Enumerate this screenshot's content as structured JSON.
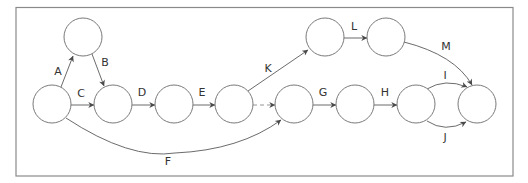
{
  "diagram": {
    "type": "activity-on-arrow network",
    "colors": {
      "border": "#8a8a8a",
      "node_stroke": "#7a7a7a",
      "edge": "#5a5a5a",
      "arrowhead": "#4a4a4a",
      "text": "#333333"
    },
    "nodes": [
      {
        "id": "n1",
        "cx": 52,
        "cy": 104
      },
      {
        "id": "n2",
        "cx": 83,
        "cy": 37
      },
      {
        "id": "n3",
        "cx": 113,
        "cy": 104
      },
      {
        "id": "n4",
        "cx": 174,
        "cy": 104
      },
      {
        "id": "n5",
        "cx": 234,
        "cy": 104
      },
      {
        "id": "n6",
        "cx": 294,
        "cy": 104
      },
      {
        "id": "n7",
        "cx": 355,
        "cy": 104
      },
      {
        "id": "n8",
        "cx": 416,
        "cy": 104
      },
      {
        "id": "n9",
        "cx": 477,
        "cy": 104
      },
      {
        "id": "n10",
        "cx": 325,
        "cy": 37
      },
      {
        "id": "n11",
        "cx": 386,
        "cy": 37
      }
    ],
    "edges": [
      {
        "label": "A",
        "from": "n1",
        "to": "n2"
      },
      {
        "label": "B",
        "from": "n2",
        "to": "n3"
      },
      {
        "label": "C",
        "from": "n1",
        "to": "n3"
      },
      {
        "label": "D",
        "from": "n3",
        "to": "n4"
      },
      {
        "label": "E",
        "from": "n4",
        "to": "n5"
      },
      {
        "label": "",
        "from": "n5",
        "to": "n6",
        "style": "dashed (dummy)"
      },
      {
        "label": "F",
        "from": "n1",
        "to": "n6"
      },
      {
        "label": "G",
        "from": "n6",
        "to": "n7"
      },
      {
        "label": "H",
        "from": "n7",
        "to": "n8"
      },
      {
        "label": "I",
        "from": "n8",
        "to": "n9"
      },
      {
        "label": "J",
        "from": "n8",
        "to": "n9"
      },
      {
        "label": "K",
        "from": "n5",
        "to": "n10"
      },
      {
        "label": "L",
        "from": "n10",
        "to": "n11"
      },
      {
        "label": "M",
        "from": "n11",
        "to": "n9"
      }
    ],
    "labels": {
      "A": "A",
      "B": "B",
      "C": "C",
      "D": "D",
      "E": "E",
      "F": "F",
      "G": "G",
      "H": "H",
      "I": "I",
      "J": "J",
      "K": "K",
      "L": "L",
      "M": "M"
    }
  }
}
